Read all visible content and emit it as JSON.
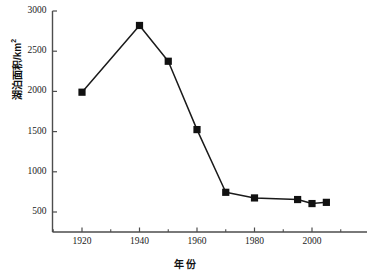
{
  "chart_data": {
    "type": "line",
    "title": "",
    "xlabel": "年份",
    "ylabel_text": "湖泊面积/km",
    "ylabel_sup": "2",
    "xlim": [
      1910,
      2010
    ],
    "ylim": [
      250,
      3000
    ],
    "grid": false,
    "legend": "none",
    "marker": "filled-square",
    "line_color": "#1a1a1a",
    "marker_color": "#111111",
    "axis_color": "#4d4d4d",
    "x": [
      1920,
      1940,
      1950,
      1960,
      1970,
      1980,
      1995,
      2000,
      2005
    ],
    "values": [
      1990,
      2820,
      2375,
      1525,
      745,
      675,
      655,
      605,
      620
    ],
    "points": [
      {
        "year": 1920,
        "area": 1990
      },
      {
        "year": 1940,
        "area": 2820
      },
      {
        "year": 1950,
        "area": 2375
      },
      {
        "year": 1960,
        "area": 1525
      },
      {
        "year": 1970,
        "area": 745
      },
      {
        "year": 1980,
        "area": 675
      },
      {
        "year": 1995,
        "area": 655
      },
      {
        "year": 2000,
        "area": 605
      },
      {
        "year": 2005,
        "area": 620
      }
    ],
    "yticks": [
      500,
      1000,
      1500,
      2000,
      2500,
      3000
    ],
    "ytick_labels": [
      "500",
      "1000",
      "1500",
      "2000",
      "2500",
      "3000"
    ],
    "xticks_major": [
      1920,
      1940,
      1960,
      1980,
      2000
    ],
    "xtick_labels": [
      "1920",
      "1940",
      "1960",
      "1980",
      "2000"
    ],
    "xticks_minor": [
      1910,
      1930,
      1950,
      1970,
      1990,
      2010
    ]
  }
}
